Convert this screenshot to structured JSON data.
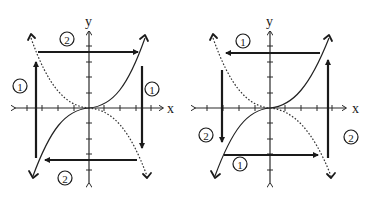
{
  "figure": {
    "panels": [
      {
        "id": "left",
        "axis_labels": {
          "x": "x",
          "y": "y"
        },
        "solid_curve": "y = x^3",
        "dotted_curve": "y = -x^3",
        "steps": [
          {
            "label": "1",
            "direction": "vertical reflection arrows (left up, right down)"
          },
          {
            "label": "2",
            "direction": "horizontal arrows (top right, bottom left)"
          }
        ],
        "badges": [
          "2",
          "1",
          "1",
          "2"
        ]
      },
      {
        "id": "right",
        "axis_labels": {
          "x": "x",
          "y": "y"
        },
        "solid_curve": "y = x^3",
        "dotted_curve": "y = -x^3",
        "steps": [
          {
            "label": "1",
            "direction": "horizontal arrows (top left, bottom right)"
          },
          {
            "label": "2",
            "direction": "vertical arrows (left down, right up)"
          }
        ],
        "badges": [
          "1",
          "2",
          "1",
          "2"
        ]
      }
    ]
  }
}
